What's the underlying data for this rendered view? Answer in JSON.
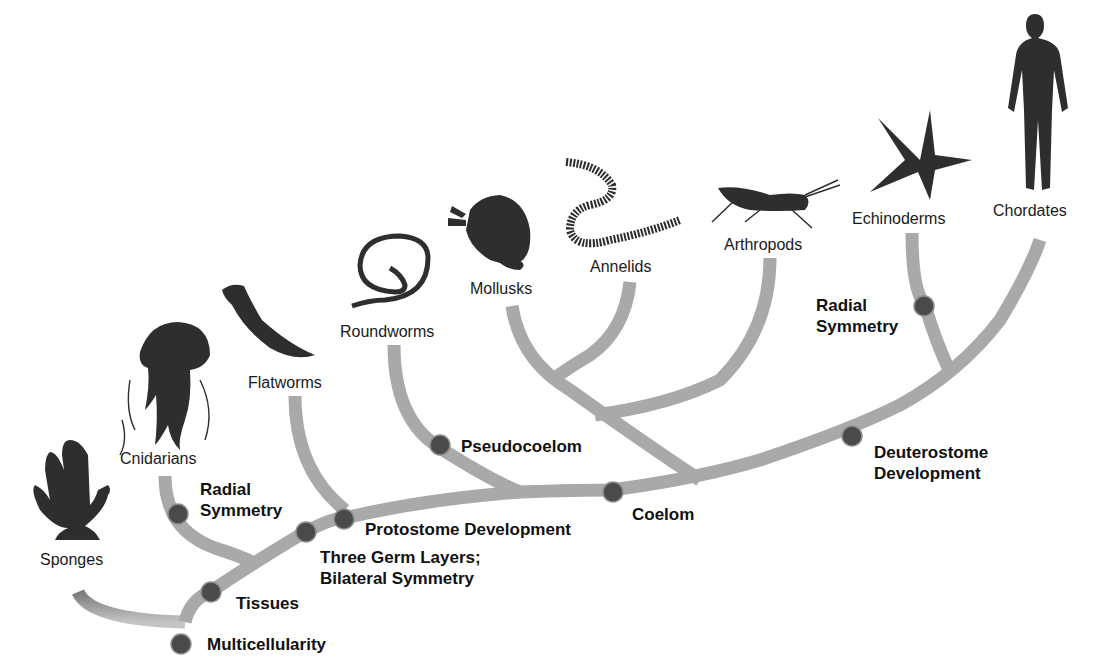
{
  "diagram": {
    "type": "phylogenetic-tree",
    "branch_color": "#a8a8a8",
    "node_color": "#4a4a4a",
    "taxa": [
      {
        "id": "sponges",
        "label": "Sponges",
        "icon": "sponge-icon"
      },
      {
        "id": "cnidarians",
        "label": "Cnidarians",
        "icon": "jellyfish-icon"
      },
      {
        "id": "flatworms",
        "label": "Flatworms",
        "icon": "flatworm-icon"
      },
      {
        "id": "roundworms",
        "label": "Roundworms",
        "icon": "roundworm-icon"
      },
      {
        "id": "mollusks",
        "label": "Mollusks",
        "icon": "clam-icon"
      },
      {
        "id": "annelids",
        "label": "Annelids",
        "icon": "segmented-worm-icon"
      },
      {
        "id": "arthropods",
        "label": "Arthropods",
        "icon": "grasshopper-icon"
      },
      {
        "id": "echinoderms",
        "label": "Echinoderms",
        "icon": "starfish-icon"
      },
      {
        "id": "chordates",
        "label": "Chordates",
        "icon": "human-icon"
      }
    ],
    "traits": [
      {
        "id": "multicellularity",
        "line1": "Multicellularity",
        "line2": ""
      },
      {
        "id": "tissues",
        "line1": "Tissues",
        "line2": ""
      },
      {
        "id": "radial-symmetry-1",
        "line1": "Radial",
        "line2": "Symmetry"
      },
      {
        "id": "three-germ-layers",
        "line1": "Three Germ Layers;",
        "line2": "Bilateral Symmetry"
      },
      {
        "id": "protostome",
        "line1": "Protostome Development",
        "line2": ""
      },
      {
        "id": "pseudocoelom",
        "line1": "Pseudocoelom",
        "line2": ""
      },
      {
        "id": "coelom",
        "line1": "Coelom",
        "line2": ""
      },
      {
        "id": "deuterostome",
        "line1": "Deuterostome",
        "line2": "Development"
      },
      {
        "id": "radial-symmetry-2",
        "line1": "Radial",
        "line2": "Symmetry"
      }
    ]
  }
}
